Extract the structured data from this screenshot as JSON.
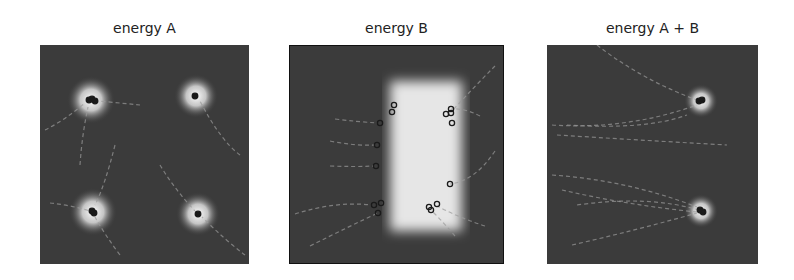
{
  "figure": {
    "panels": [
      {
        "title": "energy A",
        "left": 40
      },
      {
        "title": "energy B",
        "left": 295
      },
      {
        "title": "energy A + B",
        "left": 549
      }
    ]
  },
  "colors": {
    "background": "#3b3b3b",
    "hotspot": "#ffffff",
    "trajectory": "#9a9a9a",
    "marker": "#1a1a1a"
  },
  "chart_data": [
    {
      "type": "heatmap",
      "title": "energy A",
      "xlabel": "",
      "ylabel": "",
      "axes": "off",
      "hotspots_px": [
        {
          "x": 51,
          "y": 55,
          "r": 24
        },
        {
          "x": 156,
          "y": 51,
          "r": 22
        },
        {
          "x": 53,
          "y": 167,
          "r": 24
        },
        {
          "x": 158,
          "y": 169,
          "r": 22
        }
      ],
      "markers_px": [
        {
          "x": 49,
          "y": 55
        },
        {
          "x": 52,
          "y": 54
        },
        {
          "x": 55,
          "y": 56
        },
        {
          "x": 155,
          "y": 51
        },
        {
          "x": 52,
          "y": 166
        },
        {
          "x": 54,
          "y": 168
        },
        {
          "x": 158,
          "y": 169
        }
      ],
      "trajectories_px": [
        [
          [
            5,
            85
          ],
          [
            25,
            75
          ],
          [
            45,
            58
          ]
        ],
        [
          [
            40,
            120
          ],
          [
            42,
            90
          ],
          [
            48,
            62
          ]
        ],
        [
          [
            100,
            60
          ],
          [
            80,
            58
          ],
          [
            58,
            56
          ]
        ],
        [
          [
            200,
            110
          ],
          [
            180,
            95
          ],
          [
            160,
            56
          ]
        ],
        [
          [
            10,
            158
          ],
          [
            30,
            160
          ],
          [
            50,
            166
          ]
        ],
        [
          [
            80,
            210
          ],
          [
            65,
            190
          ],
          [
            55,
            172
          ]
        ],
        [
          [
            120,
            120
          ],
          [
            135,
            145
          ],
          [
            155,
            166
          ]
        ],
        [
          [
            205,
            210
          ],
          [
            185,
            195
          ],
          [
            162,
            172
          ]
        ],
        [
          [
            75,
            100
          ],
          [
            65,
            140
          ],
          [
            55,
            160
          ]
        ]
      ]
    },
    {
      "type": "heatmap",
      "title": "energy B",
      "xlabel": "",
      "ylabel": "",
      "axes": "off",
      "hotspots_px": [
        {
          "shape": "rect",
          "x": 100,
          "y": 35,
          "w": 72,
          "h": 150
        }
      ],
      "markers_px": [
        {
          "x": 104,
          "y": 59
        },
        {
          "x": 102,
          "y": 66
        },
        {
          "x": 161,
          "y": 63
        },
        {
          "x": 156,
          "y": 68
        },
        {
          "x": 161,
          "y": 67
        },
        {
          "x": 90,
          "y": 77
        },
        {
          "x": 162,
          "y": 77
        },
        {
          "x": 87,
          "y": 99
        },
        {
          "x": 86,
          "y": 120
        },
        {
          "x": 160,
          "y": 138
        },
        {
          "x": 84,
          "y": 159
        },
        {
          "x": 91,
          "y": 157
        },
        {
          "x": 88,
          "y": 167
        },
        {
          "x": 139,
          "y": 161
        },
        {
          "x": 141,
          "y": 164
        },
        {
          "x": 147,
          "y": 158
        }
      ],
      "trajectories_px": [
        [
          [
            45,
            73
          ],
          [
            70,
            76
          ],
          [
            88,
            77
          ]
        ],
        [
          [
            40,
            95
          ],
          [
            65,
            100
          ],
          [
            85,
            99
          ]
        ],
        [
          [
            40,
            120
          ],
          [
            65,
            121
          ],
          [
            84,
            120
          ]
        ],
        [
          [
            5,
            168
          ],
          [
            45,
            155
          ],
          [
            82,
            159
          ]
        ],
        [
          [
            20,
            200
          ],
          [
            60,
            180
          ],
          [
            88,
            167
          ]
        ],
        [
          [
            205,
            105
          ],
          [
            185,
            135
          ],
          [
            160,
            138
          ]
        ],
        [
          [
            190,
            70
          ],
          [
            175,
            62
          ],
          [
            161,
            63
          ]
        ],
        [
          [
            205,
            20
          ],
          [
            185,
            40
          ],
          [
            162,
            65
          ]
        ],
        [
          [
            195,
            180
          ],
          [
            170,
            172
          ],
          [
            147,
            160
          ]
        ],
        [
          [
            165,
            190
          ],
          [
            155,
            178
          ],
          [
            141,
            164
          ]
        ]
      ]
    },
    {
      "type": "heatmap",
      "title": "energy A + B",
      "xlabel": "",
      "ylabel": "",
      "axes": "off",
      "hotspots_px": [
        {
          "x": 154,
          "y": 56,
          "r": 17
        },
        {
          "x": 154,
          "y": 166,
          "r": 17
        }
      ],
      "markers_px": [
        {
          "x": 152,
          "y": 56
        },
        {
          "x": 155,
          "y": 55
        },
        {
          "x": 153,
          "y": 165
        },
        {
          "x": 156,
          "y": 167
        }
      ],
      "trajectories_px": [
        [
          [
            50,
            0
          ],
          [
            95,
            35
          ],
          [
            150,
            55
          ]
        ],
        [
          [
            5,
            80
          ],
          [
            80,
            85
          ],
          [
            150,
            60
          ]
        ],
        [
          [
            10,
            90
          ],
          [
            90,
            95
          ],
          [
            180,
            100
          ]
        ],
        [
          [
            20,
            80
          ],
          [
            100,
            85
          ],
          [
            140,
            70
          ]
        ],
        [
          [
            5,
            130
          ],
          [
            80,
            135
          ],
          [
            150,
            162
          ]
        ],
        [
          [
            30,
            160
          ],
          [
            100,
            150
          ],
          [
            152,
            165
          ]
        ],
        [
          [
            25,
            200
          ],
          [
            90,
            185
          ],
          [
            150,
            168
          ]
        ],
        [
          [
            15,
            145
          ],
          [
            80,
            160
          ],
          [
            150,
            167
          ]
        ]
      ]
    }
  ]
}
